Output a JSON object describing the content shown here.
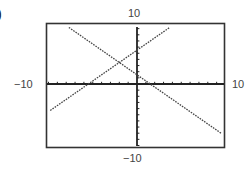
{
  "figure": {
    "part_label": ")",
    "window": {
      "xmin_label": "−10",
      "xmax_label": "10",
      "ymin_label": "−10",
      "ymax_label": "10"
    }
  },
  "chart_data": {
    "type": "line",
    "title": "",
    "xlabel": "",
    "ylabel": "",
    "xlim": [
      -10,
      10
    ],
    "ylim": [
      -10,
      10
    ],
    "grid": false,
    "axes_tick_spacing": 1,
    "style": "graphing-calculator dotted lines",
    "series": [
      {
        "name": "increasing line",
        "equation_estimate": "y = x + 5.5",
        "slope": 1,
        "y_intercept": 5.5,
        "x_intercept": -5.5,
        "points": [
          [
            -9.8,
            -4.3
          ],
          [
            3.7,
            9.2
          ]
        ]
      },
      {
        "name": "decreasing line",
        "equation_estimate": "y = -x + 1.5",
        "slope": -1,
        "y_intercept": 1.5,
        "x_intercept": 1.5,
        "points": [
          [
            -7.7,
            9.2
          ],
          [
            9.5,
            -8.0
          ]
        ]
      }
    ],
    "annotations": [
      {
        "type": "intersection",
        "x": -2,
        "y": 3.5
      }
    ],
    "tick_labels": {
      "x": [
        "−10",
        "10"
      ],
      "y": [
        "−10",
        "10"
      ]
    }
  },
  "colors": {
    "frame": "#333333",
    "axes": "#222222",
    "lines": "#444444",
    "background": "#ffffff"
  }
}
